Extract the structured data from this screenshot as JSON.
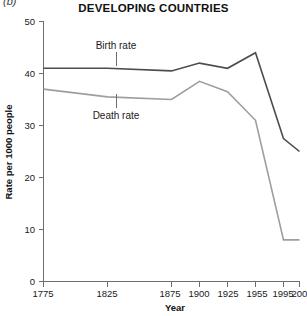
{
  "figure": {
    "panel_label": "(b)",
    "title": "DEVELOPING COUNTRIES"
  },
  "axes": {
    "ylabel": "Rate per 1000 people",
    "xlabel": "Year",
    "ytick_labels": [
      "0",
      "10",
      "20",
      "30",
      "40",
      "50"
    ],
    "xtick_labels": [
      "1775",
      "1825",
      "1875",
      "1900",
      "1925",
      "1955",
      "1995",
      "2003"
    ]
  },
  "series_labels": {
    "birth": "Birth rate",
    "death": "Death rate"
  },
  "colors": {
    "birth_rate_line": "#4d4d4d",
    "death_rate_line": "#9e9e9e",
    "axis": "#6e6e6e",
    "text": "#1a1a1a",
    "background": "#ffffff"
  },
  "chart_data": {
    "type": "line",
    "title": "DEVELOPING COUNTRIES",
    "xlabel": "Year",
    "ylabel": "Rate per 1000 people",
    "ylim": [
      0,
      50
    ],
    "yticks": [
      0,
      10,
      20,
      30,
      40,
      50
    ],
    "xticks": [
      1775,
      1825,
      1875,
      1900,
      1925,
      1955,
      1995,
      2003
    ],
    "x_axis_scale": "non-linear category positions",
    "grid": false,
    "legend": "inline labels with leader lines",
    "annotations": [
      {
        "text": "Birth rate",
        "points_to_series": "Birth rate",
        "at_year": 1840
      },
      {
        "text": "Death rate",
        "points_to_series": "Death rate",
        "at_year": 1840
      }
    ],
    "x": [
      1775,
      1825,
      1875,
      1900,
      1925,
      1955,
      1995,
      2003
    ],
    "series": [
      {
        "name": "Birth rate",
        "color": "#4d4d4d",
        "values": [
          41.0,
          41.0,
          40.5,
          42.0,
          41.0,
          44.0,
          27.5,
          25.0
        ]
      },
      {
        "name": "Death rate",
        "color": "#9e9e9e",
        "values": [
          37.0,
          35.5,
          35.0,
          38.5,
          36.5,
          31.0,
          8.0,
          8.0
        ]
      }
    ]
  }
}
